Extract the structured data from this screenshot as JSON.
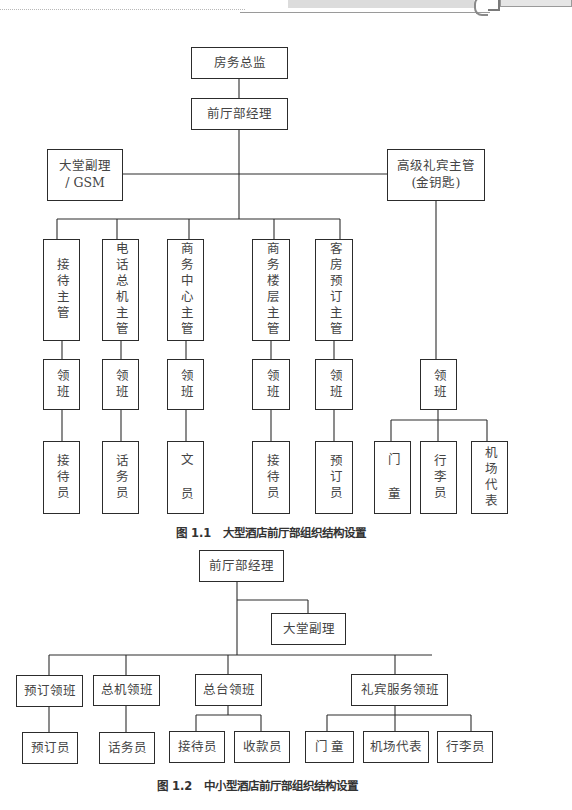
{
  "figure1": {
    "caption": "图 1.1   大型酒店前厅部组织结构设置",
    "nodes": {
      "director": "房务总监",
      "fo_manager": "前厅部经理",
      "asst_manager_l1": "大堂副理",
      "asst_manager_l2": "/ GSM",
      "concierge_l1": "高级礼宾主管",
      "concierge_l2": "(金钥匙)",
      "supervisors": [
        "接待主管",
        "电话总机主管",
        "商务中心主管",
        "商务楼层主管",
        "客房预订主管"
      ],
      "captains": [
        "领班",
        "领班",
        "领班",
        "领班",
        "领班"
      ],
      "staff": [
        "接待员",
        "话务员",
        "文 员",
        "接待员",
        "预订员"
      ],
      "concierge_captain": "领班",
      "concierge_staff": [
        "门 童",
        "行李员",
        "机场代表"
      ]
    }
  },
  "figure2": {
    "caption": "图 1.2   中小型酒店前厅部组织结构设置",
    "nodes": {
      "fo_manager": "前厅部经理",
      "asst_manager": "大堂副理",
      "captains": [
        "预订领班",
        "总机领班",
        "总台领班",
        "礼宾服务领班"
      ],
      "staff": [
        "预订员",
        "话务员",
        "接待员",
        "收款员",
        "门 童",
        "机场代表",
        "行李员"
      ]
    }
  },
  "colors": {
    "line": "#2c2c2c",
    "text": "#444444",
    "header_band": "#dcdcdc"
  }
}
